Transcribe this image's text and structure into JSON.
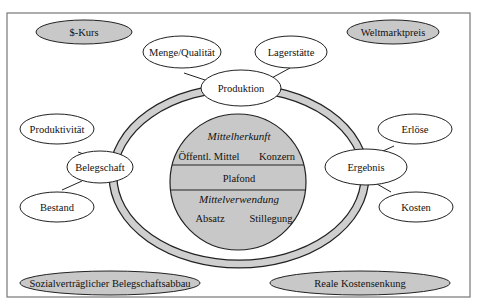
{
  "diagram": {
    "colors": {
      "frame": "#777777",
      "stroke": "#222222",
      "grey_fill": "#c8c8c8",
      "ring_fill": "#cfcfcf",
      "white": "#ffffff"
    },
    "outer_nodes": {
      "dollar_rate": "$-Kurs",
      "world_price": "Weltmarktpreis",
      "social_reduction": "Sozialverträglicher Belegschaftsabbau",
      "real_cost_reduction": "Reale Kostensenkung"
    },
    "production": {
      "label": "Produktion",
      "children": [
        "Menge/Qualität",
        "Lagerstätte"
      ]
    },
    "workforce": {
      "label": "Belegschaft",
      "children": [
        "Produktivität",
        "Bestand"
      ]
    },
    "result": {
      "label": "Ergebnis",
      "children": [
        "Erlöse",
        "Kosten"
      ]
    },
    "center": {
      "origin_title": "Mittelherkunft",
      "origin_items": [
        "Öffentl. Mittel",
        "Konzern"
      ],
      "ceiling": "Plafond",
      "use_title": "Mittelverwendung",
      "use_items": [
        "Absatz",
        "Stillegung"
      ]
    }
  }
}
